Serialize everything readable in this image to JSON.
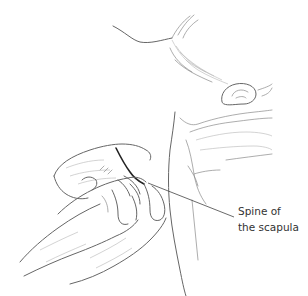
{
  "figure": {
    "type": "anatomical-illustration",
    "label": {
      "line1": "Spine of",
      "line2": "the scapula"
    },
    "leader_line": {
      "x1": 148,
      "y1": 183,
      "x2": 234,
      "y2": 217
    },
    "colors": {
      "background": "#ffffff",
      "line_art": "#555555",
      "label_text": "#333333"
    }
  }
}
